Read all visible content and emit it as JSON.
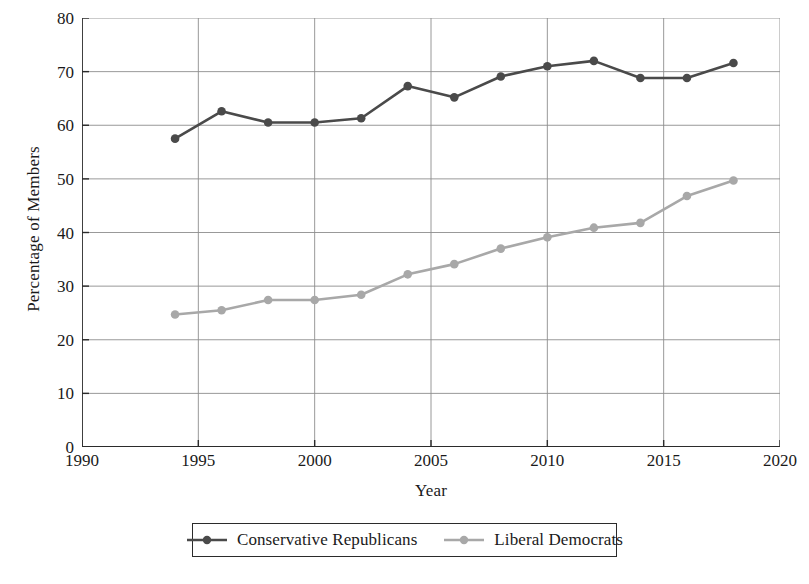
{
  "chart_data": {
    "type": "line",
    "title": "",
    "xlabel": "Year",
    "ylabel": "Percentage of Members",
    "xlim": [
      1990,
      2020
    ],
    "ylim": [
      0,
      80
    ],
    "xticks": [
      1990,
      1995,
      2000,
      2005,
      2010,
      2015,
      2020
    ],
    "yticks": [
      0,
      10,
      20,
      30,
      40,
      50,
      60,
      70,
      80
    ],
    "grid": true,
    "legend_position": "below-center",
    "x": [
      1994,
      1996,
      1998,
      2000,
      2002,
      2004,
      2006,
      2008,
      2010,
      2012,
      2014,
      2016,
      2018
    ],
    "series": [
      {
        "name": "Conservative Republicans",
        "color": "#4a4a4a",
        "marker": "circle",
        "values": [
          57.5,
          62.6,
          60.5,
          60.5,
          61.3,
          67.3,
          65.2,
          69.1,
          71.0,
          72.0,
          68.8,
          68.8,
          71.6
        ]
      },
      {
        "name": "Liberal Democrats",
        "color": "#a8a8a8",
        "marker": "circle",
        "values": [
          24.7,
          25.5,
          27.4,
          27.4,
          28.4,
          32.2,
          34.1,
          37.0,
          39.1,
          40.9,
          41.8,
          46.8,
          49.7
        ]
      }
    ]
  },
  "axis": {
    "y_tick_labels": [
      "80",
      "70",
      "60",
      "50",
      "40",
      "30",
      "20",
      "10",
      "0"
    ],
    "x_tick_labels": [
      "1990",
      "1995",
      "2000",
      "2005",
      "2010",
      "2015",
      "2020"
    ],
    "y_title": "Percentage of Members",
    "x_title": "Year"
  },
  "legend": {
    "entries": [
      {
        "label": "Conservative Republicans"
      },
      {
        "label": "Liberal Democrats"
      }
    ]
  },
  "style": {
    "axis_color": "#2b2b2b",
    "grid_color": "#8d8d8d",
    "series_dark": "#4a4a4a",
    "series_light": "#a8a8a8",
    "background": "#ffffff"
  }
}
